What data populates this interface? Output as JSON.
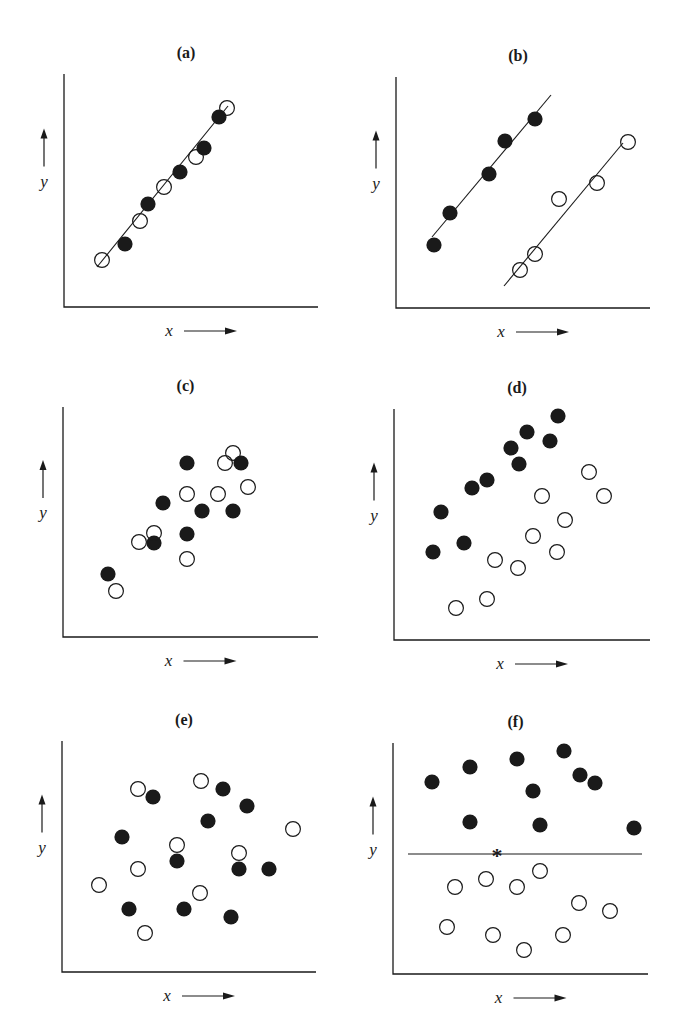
{
  "figure": {
    "colors": {
      "ink": "#1a1a1a",
      "background": "#ffffff"
    },
    "axis_labels": {
      "x": "x",
      "y": "y"
    }
  },
  "chart_data": [
    {
      "id": "a",
      "title": "(a)",
      "type": "scatter",
      "xlabel": "x",
      "ylabel": "y",
      "frame": {
        "left": 64,
        "top": 74,
        "bottom": 307,
        "right": 318
      },
      "lines": [
        {
          "x1": 97,
          "y1": 267,
          "x2": 228,
          "y2": 106
        }
      ],
      "series": [
        {
          "name": "filled",
          "points": [
            [
              125,
              244
            ],
            [
              148,
              204
            ],
            [
              180,
              172
            ],
            [
              204,
              148
            ],
            [
              219,
              117
            ]
          ]
        },
        {
          "name": "open",
          "points": [
            [
              102,
              260
            ],
            [
              140,
              221
            ],
            [
              164,
              187
            ],
            [
              196,
              157
            ],
            [
              227,
              108
            ]
          ]
        }
      ]
    },
    {
      "id": "b",
      "title": "(b)",
      "type": "scatter",
      "xlabel": "x",
      "ylabel": "y",
      "frame": {
        "left": 396,
        "top": 77,
        "bottom": 308,
        "right": 650
      },
      "lines": [
        {
          "x1": 432,
          "y1": 237,
          "x2": 551,
          "y2": 95
        },
        {
          "x1": 504,
          "y1": 286,
          "x2": 623,
          "y2": 143
        }
      ],
      "series": [
        {
          "name": "filled",
          "points": [
            [
              434,
              245
            ],
            [
              450,
              213
            ],
            [
              489,
              174
            ],
            [
              505,
              141
            ],
            [
              535,
              119
            ]
          ]
        },
        {
          "name": "open",
          "points": [
            [
              520,
              270
            ],
            [
              535,
              254
            ],
            [
              559,
              199
            ],
            [
              597,
              183
            ],
            [
              628,
              142
            ]
          ]
        }
      ]
    },
    {
      "id": "c",
      "title": "(c)",
      "type": "scatter",
      "xlabel": "x",
      "ylabel": "y",
      "frame": {
        "left": 63,
        "top": 407,
        "bottom": 637,
        "right": 318
      },
      "lines": [],
      "series": [
        {
          "name": "filled",
          "points": [
            [
              108,
              574
            ],
            [
              154,
              543
            ],
            [
              163,
              503
            ],
            [
              187,
              534
            ],
            [
              187,
              463
            ],
            [
              202,
              511
            ],
            [
              233,
              511
            ],
            [
              241,
              463
            ]
          ]
        },
        {
          "name": "open",
          "points": [
            [
              116,
              591
            ],
            [
              139,
              542
            ],
            [
              154,
              533
            ],
            [
              187,
              559
            ],
            [
              187,
              494
            ],
            [
              218,
              494
            ],
            [
              225,
              463
            ],
            [
              233,
              453
            ],
            [
              248,
              487
            ]
          ]
        }
      ]
    },
    {
      "id": "d",
      "title": "(d)",
      "type": "scatter",
      "xlabel": "x",
      "ylabel": "y",
      "frame": {
        "left": 394,
        "top": 409,
        "bottom": 640,
        "right": 650
      },
      "lines": [],
      "series": [
        {
          "name": "filled",
          "points": [
            [
              433,
              552
            ],
            [
              441,
              512
            ],
            [
              464,
              543
            ],
            [
              472,
              488
            ],
            [
              487,
              480
            ],
            [
              511,
              448
            ],
            [
              519,
              464
            ],
            [
              527,
              432
            ],
            [
              550,
              441
            ],
            [
              558,
              416
            ]
          ]
        },
        {
          "name": "open",
          "points": [
            [
              456,
              608
            ],
            [
              487,
              599
            ],
            [
              495,
              560
            ],
            [
              518,
              568
            ],
            [
              533,
              536
            ],
            [
              542,
              496
            ],
            [
              557,
              552
            ],
            [
              565,
              520
            ],
            [
              589,
              472
            ],
            [
              604,
              496
            ]
          ]
        }
      ]
    },
    {
      "id": "e",
      "title": "(e)",
      "type": "scatter",
      "xlabel": "x",
      "ylabel": "y",
      "frame": {
        "left": 62,
        "top": 741,
        "bottom": 972,
        "right": 316
      },
      "lines": [],
      "series": [
        {
          "name": "filled",
          "points": [
            [
              153,
              797
            ],
            [
              223,
              789
            ],
            [
              247,
              806
            ],
            [
              208,
              821
            ],
            [
              122,
              837
            ],
            [
              177,
              861
            ],
            [
              239,
              869
            ],
            [
              269,
              869
            ],
            [
              129,
              909
            ],
            [
              184,
              909
            ],
            [
              231,
              917
            ]
          ]
        },
        {
          "name": "open",
          "points": [
            [
              138,
              789
            ],
            [
              201,
              781
            ],
            [
              293,
              829
            ],
            [
              177,
              845
            ],
            [
              239,
              853
            ],
            [
              138,
              869
            ],
            [
              99,
              885
            ],
            [
              200,
              893
            ],
            [
              145,
              933
            ]
          ]
        }
      ]
    },
    {
      "id": "f",
      "title": "(f)",
      "type": "scatter",
      "xlabel": "x",
      "ylabel": "y",
      "frame": {
        "left": 393,
        "top": 743,
        "bottom": 974,
        "right": 648
      },
      "lines": [
        {
          "x1": 408,
          "y1": 854,
          "x2": 642,
          "y2": 854
        }
      ],
      "markers": [
        {
          "symbol": "*",
          "x": 497,
          "y": 854
        }
      ],
      "series": [
        {
          "name": "filled",
          "points": [
            [
              432,
              782
            ],
            [
              470,
              767
            ],
            [
              517,
              759
            ],
            [
              564,
              751
            ],
            [
              580,
              775
            ],
            [
              595,
              783
            ],
            [
              533,
              791
            ],
            [
              470,
              822
            ],
            [
              540,
              825
            ],
            [
              634,
              828
            ]
          ]
        },
        {
          "name": "open",
          "points": [
            [
              455,
              887
            ],
            [
              486,
              879
            ],
            [
              517,
              887
            ],
            [
              540,
              871
            ],
            [
              579,
              903
            ],
            [
              610,
              911
            ],
            [
              447,
              927
            ],
            [
              493,
              935
            ],
            [
              524,
              950
            ],
            [
              563,
              935
            ]
          ]
        }
      ]
    }
  ]
}
